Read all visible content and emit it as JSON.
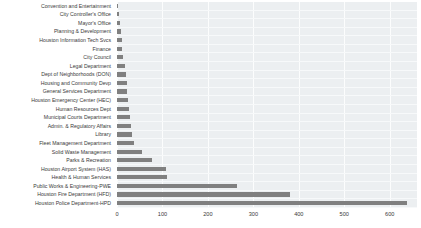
{
  "chart_data": {
    "type": "bar",
    "orientation": "horizontal",
    "title": "",
    "xlabel": "",
    "ylabel": "",
    "xlim": [
      0,
      660
    ],
    "xticks": [
      0,
      100,
      200,
      300,
      400,
      500,
      600
    ],
    "grid": true,
    "legend": false,
    "bar_color": "#808080",
    "plot_background": "#eceff1",
    "categories": [
      "Convention and Entertainment",
      "City Controller's Office",
      "Mayor's Office",
      "Planning & Development",
      "Houston Information Tech Svcs",
      "Finance",
      "City Council",
      "Legal Department",
      "Dept of Neighborhoods (DON)",
      "Housing and Community Devp",
      "General Services Department",
      "Houston Emergency Center (HEC)",
      "Human Resources Dept",
      "Municipal Courts Department",
      "Admin. & Regulatory Affairs",
      "Library",
      "Fleet Management Department",
      "Solid Waste Management",
      "Parks & Recreation",
      "Houston Airport System (HAS)",
      "Health & Human Services",
      "Public Works & Engineering-PWE",
      "Houston Fire Department (HFD)",
      "Houston Police Department-HPD"
    ],
    "values": [
      2,
      5,
      6,
      8,
      10,
      12,
      14,
      17,
      19,
      21,
      23,
      25,
      26,
      28,
      30,
      33,
      37,
      55,
      78,
      108,
      110,
      265,
      380,
      638
    ]
  }
}
